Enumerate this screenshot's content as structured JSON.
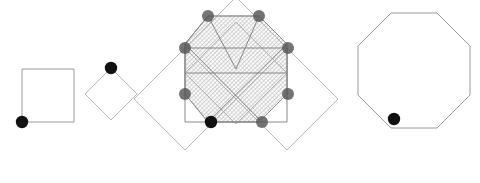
{
  "canvas": {
    "width": 480,
    "height": 183,
    "background": "#ffffff",
    "title": "Octagon construction from overlapping squares"
  },
  "style": {
    "outline_stroke": "#b0b0b0",
    "outline_stroke_dark": "#8e8e8e",
    "inner_stroke": "#7a7a7a",
    "hatch_stroke": "#a8a8a8",
    "dot_dark": "#111111",
    "dot_gray": "#555555",
    "stroke_width": 0.9,
    "hatch_angle_deg": 45,
    "hatch_spacing": 3
  },
  "figures": [
    {
      "id": "figure-1",
      "name": "axis-aligned-square",
      "label": "Square",
      "shape": "square",
      "rotation_deg": 0,
      "points": "22,69 74,69 74,122 22,122",
      "marked_vertex": {
        "x": 22,
        "y": 122,
        "r": 6.2,
        "color": "#111111"
      }
    },
    {
      "id": "figure-2",
      "name": "rotated-square-diamond",
      "label": "Rotated square",
      "shape": "square",
      "rotation_deg": 45,
      "points": "111,68 137,94 111,120 85,94",
      "marked_vertex": {
        "x": 111,
        "y": 68,
        "r": 6.2,
        "color": "#111111"
      }
    },
    {
      "id": "figure-3",
      "name": "overlay-construction",
      "label": "Overlay construction",
      "shape": "composite",
      "center": {
        "x": 235,
        "y": 69
      },
      "base_square": "185,48 287,48 287,122 185,122",
      "diamonds": [
        {
          "name": "diamond-top",
          "points": "236,-3 287,48 236,99 185,48"
        },
        {
          "name": "diamond-left",
          "points": "185,48 236,99 185,150 134,99"
        },
        {
          "name": "diamond-right",
          "points": "287,48 338,99 287,150 236,99"
        },
        {
          "name": "diamond-bottom",
          "points": "236,22 287,73 236,124 185,73"
        }
      ],
      "octagon": "208,16 259,16 287,44 287,94 259,122 208,122 185,94 185,44",
      "inner_lines": [
        {
          "name": "diagonal-nw-se",
          "x1": 185,
          "y1": 44,
          "x2": 262,
          "y2": 122
        },
        {
          "name": "diagonal-ne-sw",
          "x1": 287,
          "y1": 44,
          "x2": 208,
          "y2": 122
        },
        {
          "name": "chord-top-left",
          "x1": 208,
          "y1": 16,
          "x2": 185,
          "y2": 44
        },
        {
          "name": "chord-top-right",
          "x1": 259,
          "y1": 16,
          "x2": 287,
          "y2": 44
        },
        {
          "name": "edge-vertical-left",
          "x1": 185,
          "y1": 44,
          "x2": 185,
          "y2": 94
        },
        {
          "name": "edge-vertical-right",
          "x1": 287,
          "y1": 44,
          "x2": 287,
          "y2": 94
        },
        {
          "name": "edge-horizontal-mid",
          "x1": 185,
          "y1": 73,
          "x2": 287,
          "y2": 73
        },
        {
          "name": "edge-horizontal-bottom",
          "x1": 208,
          "y1": 122,
          "x2": 262,
          "y2": 122
        },
        {
          "name": "ray-top-left",
          "x1": 208,
          "y1": 16,
          "x2": 236,
          "y2": 69
        },
        {
          "name": "ray-top-right",
          "x1": 259,
          "y1": 16,
          "x2": 236,
          "y2": 69
        }
      ],
      "vertices": [
        {
          "name": "vertex-top-left",
          "x": 208,
          "y": 16,
          "r": 6.0,
          "color": "#555555",
          "filled_dark": false
        },
        {
          "name": "vertex-top-right",
          "x": 259,
          "y": 16,
          "r": 6.0,
          "color": "#555555",
          "filled_dark": false
        },
        {
          "name": "vertex-upper-left",
          "x": 185,
          "y": 48,
          "r": 6.0,
          "color": "#555555",
          "filled_dark": false
        },
        {
          "name": "vertex-upper-right",
          "x": 288,
          "y": 48,
          "r": 6.0,
          "color": "#555555",
          "filled_dark": false
        },
        {
          "name": "vertex-lower-left",
          "x": 185,
          "y": 94,
          "r": 6.0,
          "color": "#555555",
          "filled_dark": false
        },
        {
          "name": "vertex-lower-right",
          "x": 288,
          "y": 94,
          "r": 6.0,
          "color": "#555555",
          "filled_dark": false
        },
        {
          "name": "vertex-bottom-left",
          "x": 211,
          "y": 122,
          "r": 6.2,
          "color": "#111111",
          "filled_dark": true
        },
        {
          "name": "vertex-bottom-right",
          "x": 262,
          "y": 122,
          "r": 6.0,
          "color": "#555555",
          "filled_dark": false
        }
      ]
    },
    {
      "id": "figure-4",
      "name": "resulting-octagon",
      "label": "Octagon",
      "shape": "octagon",
      "points": "391,13 437,13 470,46 470,95 437,128 391,128 358,95 358,46",
      "marked_vertex": {
        "x": 394,
        "y": 119,
        "r": 6.2,
        "color": "#111111"
      }
    }
  ]
}
